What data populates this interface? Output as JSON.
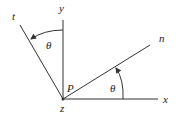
{
  "diagram": {
    "labels": {
      "y_axis": "y",
      "x_axis": "x",
      "t_axis": "t",
      "n_axis": "n",
      "z_axis": "z",
      "point": "P",
      "angle_top": "θ",
      "angle_right": "θ"
    },
    "colors": {
      "line": "#333333",
      "background": "#ffffff"
    }
  }
}
